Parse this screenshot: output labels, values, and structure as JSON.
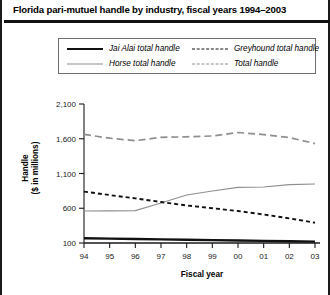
{
  "chart_data": {
    "type": "line",
    "title": "Florida pari-mutuel handle by industry, fiscal years 1994–2003",
    "xlabel": "Fiscal year",
    "ylabel": "Handle\n($ in millions)",
    "ylabel_line1": "Handle",
    "ylabel_line2": "($ in millions)",
    "categories": [
      "94",
      "95",
      "96",
      "97",
      "98",
      "99",
      "00",
      "01",
      "02",
      "03"
    ],
    "yticks": [
      "100",
      "600",
      "1,100",
      "1,600",
      "2,100"
    ],
    "ytick_values": [
      100,
      600,
      1100,
      1600,
      2100
    ],
    "ylim": [
      100,
      2100
    ],
    "grid": false,
    "legend_position": "top",
    "series": [
      {
        "name": "Jai Alai total handle",
        "style": "solid-thick",
        "color": "#111111",
        "values": [
          168,
          163,
          157,
          152,
          147,
          142,
          137,
          131,
          126,
          120
        ]
      },
      {
        "name": "Horse total handle",
        "style": "solid-thin",
        "color": "#8e8e8e",
        "values": [
          560,
          562,
          566,
          675,
          790,
          848,
          900,
          905,
          940,
          950
        ]
      },
      {
        "name": "Greyhound total handle",
        "style": "dashed-fine",
        "color": "#111111",
        "values": [
          840,
          790,
          742,
          690,
          640,
          600,
          560,
          510,
          455,
          392
        ]
      },
      {
        "name": "Total handle",
        "style": "dashed-long",
        "color": "#8e8e8e",
        "values": [
          1662,
          1608,
          1572,
          1620,
          1628,
          1640,
          1690,
          1660,
          1618,
          1530
        ]
      }
    ]
  },
  "legend": {
    "items": [
      {
        "label": "Jai Alai total handle"
      },
      {
        "label": "Greyhound total handle"
      },
      {
        "label": "Horse total handle"
      },
      {
        "label": "Total handle"
      }
    ]
  }
}
